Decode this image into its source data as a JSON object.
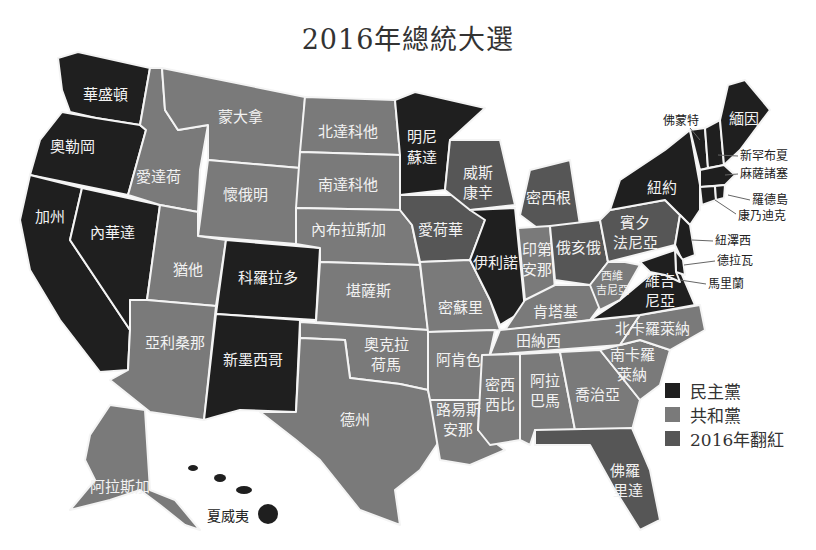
{
  "title": "2016年總統大選",
  "colors": {
    "dem": "#1f1f1f",
    "rep": "#7a7a7a",
    "flipped": "#565656",
    "border": "#f4f4f4"
  },
  "legend": [
    {
      "label": "民主黨",
      "key": "dem",
      "color": "#1f1f1f"
    },
    {
      "label": "共和黨",
      "key": "rep",
      "color": "#7a7a7a"
    },
    {
      "label": "2016年翻紅",
      "key": "flipped",
      "color": "#565656"
    }
  ],
  "states": {
    "wa": {
      "name": "華盛頓",
      "party": "dem"
    },
    "or": {
      "name": "奧勒岡",
      "party": "dem"
    },
    "ca": {
      "name": "加州",
      "party": "dem"
    },
    "nv": {
      "name": "內華達",
      "party": "dem"
    },
    "id": {
      "name": "愛達荷",
      "party": "rep"
    },
    "mt": {
      "name": "蒙大拿",
      "party": "rep"
    },
    "wy": {
      "name": "懷俄明",
      "party": "rep"
    },
    "ut": {
      "name": "猶他",
      "party": "rep"
    },
    "co": {
      "name": "科羅拉多",
      "party": "dem"
    },
    "az": {
      "name": "亞利桑那",
      "party": "rep"
    },
    "nm": {
      "name": "新墨西哥",
      "party": "dem"
    },
    "nd": {
      "name": "北達科他",
      "party": "rep"
    },
    "sd": {
      "name": "南達科他",
      "party": "rep"
    },
    "ne": {
      "name": "內布拉斯加",
      "party": "rep"
    },
    "ks": {
      "name": "堪薩斯",
      "party": "rep"
    },
    "ok_1": "奧克拉",
    "ok_2": "荷馬",
    "tx": {
      "name": "德州",
      "party": "rep"
    },
    "mn_1": "明尼",
    "mn_2": "蘇達",
    "ia": {
      "name": "愛荷華",
      "party": "flipped"
    },
    "mo": {
      "name": "密蘇里",
      "party": "rep"
    },
    "ar": {
      "name": "阿肯色",
      "party": "rep"
    },
    "la_1": "路易斯",
    "la_2": "安那",
    "wi_1": "威斯",
    "wi_2": "康辛",
    "il": {
      "name": "伊利諾",
      "party": "dem"
    },
    "mi": {
      "name": "密西根",
      "party": "flipped"
    },
    "in_1": "印第",
    "in_2": "安那",
    "oh": {
      "name": "俄亥俄",
      "party": "flipped"
    },
    "ky": {
      "name": "肯塔基",
      "party": "rep"
    },
    "tn": {
      "name": "田納西",
      "party": "rep"
    },
    "ms_1": "密西",
    "ms_2": "西比",
    "al_1": "阿拉",
    "al_2": "巴馬",
    "ga": {
      "name": "喬治亞",
      "party": "rep"
    },
    "fl_1": "佛羅",
    "fl_2": "里達",
    "sc_1": "南卡羅",
    "sc_2": "萊納",
    "nc": {
      "name": "北卡羅萊納",
      "party": "rep"
    },
    "va_1": "維吉",
    "va_2": "尼亞",
    "wv_1": "西維",
    "wv_2": "吉尼亞",
    "pa_1": "賓夕",
    "pa_2": "法尼亞",
    "ny": {
      "name": "紐約",
      "party": "dem"
    },
    "me": {
      "name": "緬因",
      "party": "dem"
    },
    "vt": {
      "name": "佛蒙特",
      "party": "dem"
    },
    "nh": {
      "name": "新罕布夏",
      "party": "dem"
    },
    "ma": {
      "name": "麻薩諸塞",
      "party": "dem"
    },
    "ri": {
      "name": "羅德島",
      "party": "dem"
    },
    "ct": {
      "name": "康乃迪克",
      "party": "dem"
    },
    "nj": {
      "name": "紐澤西",
      "party": "dem"
    },
    "de": {
      "name": "德拉瓦",
      "party": "dem"
    },
    "md": {
      "name": "馬里蘭",
      "party": "dem"
    },
    "ak": {
      "name": "阿拉斯加",
      "party": "rep"
    },
    "hi": {
      "name": "夏威夷",
      "party": "dem"
    }
  }
}
